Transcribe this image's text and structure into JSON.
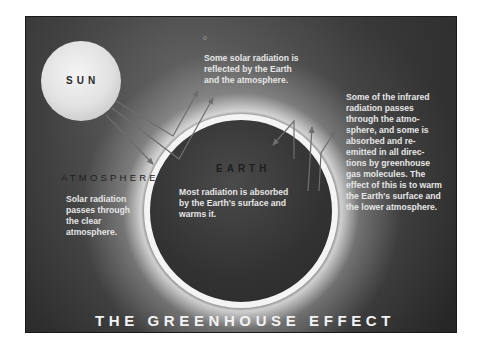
{
  "diagram": {
    "title": "THE GREENHOUSE EFFECT",
    "labels": {
      "sun": "SUN",
      "earth": "EARTH",
      "atmosphere": "ATMOSPHERE"
    },
    "captions": {
      "reflected": "Some solar radiation is\nreflected by the Earth\nand the atmosphere.",
      "infrared": "Some of the infrared\nradiation passes\nthrough the atmo-\nsphere, and some is\nabsorbed and re-\nemitted in all direc-\ntions by greenhouse\ngas molecules.  The\neffect of this is to warm\nthe Earth's surface and\nthe lower atmosphere.",
      "solar": "Solar radiation\npasses through\nthe clear\natmosphere.",
      "absorbed": "Most radiation is absorbed\nby the Earth's surface and\nwarms it."
    },
    "marker": "o",
    "colors": {
      "background": "#2b2b2b",
      "sun": "#e8e8e8",
      "ring": "#f4f4f4",
      "arrow": "#6e6e6e",
      "caption_text": "#e6e6e6",
      "label_text": "#1e1e1e"
    }
  }
}
